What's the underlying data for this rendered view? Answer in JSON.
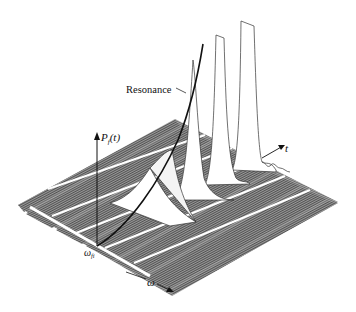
{
  "figure": {
    "type": "3d-waterfall-diagram",
    "labels": {
      "vertical_axis": "P",
      "vertical_axis_sub": "f",
      "vertical_axis_arg": "(t)",
      "time_axis": "t",
      "frequency_axis": "ω",
      "origin": "ω",
      "origin_sub": "fi",
      "curve": "Resonance"
    },
    "colors": {
      "background": "#ffffff",
      "strip_fill": "#8a8a8a",
      "strip_hatch": "#5a5a5a",
      "peak_fill": "#ffffff",
      "line": "#111111"
    },
    "strips": 7
  }
}
